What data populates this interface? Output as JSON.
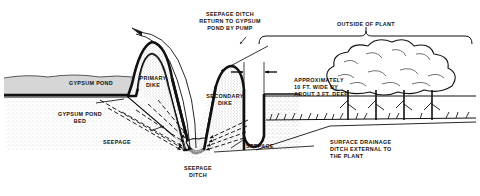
{
  "diagram": {
    "type": "cross-section-illustration",
    "background_color": "#ffffff",
    "ink_color": "#111111",
    "fill_color": "#d8d8d8"
  },
  "labels": {
    "seepage_ditch_return": "SEEPAGE DITCH\nRETURN TO GYPSUM\nPOND BY PUMP",
    "outside_of_plant": "OUTSIDE OF PLANT",
    "gypsum_pond": "GYPSUM POND",
    "gypsum_pond_bed": "GYPSUM POND\nBED",
    "primary_dike": "PRIMARY\nDIKE",
    "secondary_dike": "SECONDARY\nDIKE",
    "seepage_left": "SEEPAGE",
    "seepage_right": "SEEPAGE",
    "seepage_ditch": "SEEPAGE\nDITCH",
    "approximate_dimensions": "APPROXIMATELY\n10 FT. WIDE BY\nABOUT 3 FT. DEEP",
    "surface_drainage_ditch": "SURFACE DRAINAGE\nDITCH EXTERNAL TO\nTHE PLANT"
  },
  "features": {
    "pond_name": "Gypsum Pond",
    "pond_bed_name": "Gypsum Pond Bed",
    "primary_dike_name": "Primary Dike",
    "secondary_dike_name": "Secondary Dike",
    "seepage_ditch_name": "Seepage Ditch",
    "drainage_ditch_name": "Surface Drainage Ditch",
    "tree_line_name": "Tree Line",
    "pump_return_pipe_name": "Pump Return Pipe"
  },
  "dimensions": {
    "ditch_width": "10 FT. WIDE",
    "ditch_depth": "ABOUT 3 FT. DEEP",
    "qualifier": "APPROXIMATELY"
  }
}
